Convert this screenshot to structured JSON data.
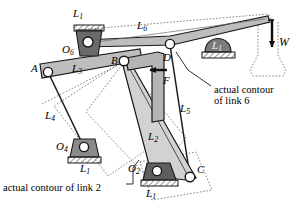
{
  "figure": {
    "colors": {
      "stroke": "#1a1a1a",
      "link_gray": "#b9b9b9",
      "link_gray_light": "#cfcfcf",
      "ground_dark": "#6e6e6e",
      "ground_mid": "#8d8d8d",
      "dotted": "#7a7a7a",
      "pin_fill": "#ffffff"
    }
  },
  "labels": [
    {
      "id": "L1_top",
      "base": "L",
      "sub": "1",
      "x": 73,
      "y": 8,
      "name": "label-l1-top"
    },
    {
      "id": "L6",
      "base": "L",
      "sub": "6",
      "x": 137,
      "y": 20,
      "name": "label-l6"
    },
    {
      "id": "O6",
      "base": "O",
      "sub": "6",
      "x": 62,
      "y": 44,
      "name": "label-o6"
    },
    {
      "id": "L1_right",
      "base": "L",
      "sub": "1",
      "x": 212,
      "y": 40,
      "name": "label-l1-right"
    },
    {
      "id": "W",
      "base": "W",
      "sub": "",
      "x": 279,
      "y": 36,
      "name": "label-w"
    },
    {
      "id": "A",
      "base": "A",
      "sub": "",
      "x": 31,
      "y": 63,
      "name": "label-a"
    },
    {
      "id": "L3",
      "base": "L",
      "sub": "3",
      "x": 72,
      "y": 66,
      "name": "label-l3"
    },
    {
      "id": "B",
      "base": "B",
      "sub": "",
      "x": 111,
      "y": 57,
      "name": "label-b"
    },
    {
      "id": "D",
      "base": "D",
      "sub": "",
      "x": 163,
      "y": 54,
      "name": "label-d"
    },
    {
      "id": "F",
      "base": "F",
      "sub": "",
      "x": 163,
      "y": 78,
      "name": "label-f"
    },
    {
      "id": "L5",
      "base": "L",
      "sub": "5",
      "x": 180,
      "y": 103,
      "name": "label-l5"
    },
    {
      "id": "L4",
      "base": "L",
      "sub": "4",
      "x": 45,
      "y": 110,
      "name": "label-l4"
    },
    {
      "id": "L2",
      "base": "L",
      "sub": "2",
      "x": 148,
      "y": 131,
      "name": "label-l2"
    },
    {
      "id": "O4",
      "base": "O",
      "sub": "4",
      "x": 56,
      "y": 141,
      "name": "label-o4"
    },
    {
      "id": "L1_o4",
      "base": "L",
      "sub": "1",
      "x": 80,
      "y": 163,
      "name": "label-l1-o4"
    },
    {
      "id": "O2",
      "base": "O",
      "sub": "2",
      "x": 128,
      "y": 165,
      "name": "label-o2"
    },
    {
      "id": "C",
      "base": "C",
      "sub": "",
      "x": 197,
      "y": 166,
      "name": "label-c"
    },
    {
      "id": "L1_o2",
      "base": "L",
      "sub": "1",
      "x": 146,
      "y": 189,
      "name": "label-l1-o2"
    }
  ],
  "captions": [
    {
      "id": "contour6",
      "lines": [
        "actual contour",
        "of link 6"
      ],
      "x": 214,
      "y": 84,
      "name": "caption-actual-contour-link6"
    },
    {
      "id": "contour2",
      "lines": [
        "actual contour of link 2"
      ],
      "x": 3,
      "y": 183,
      "name": "caption-actual-contour-link2"
    }
  ],
  "joints": [
    {
      "id": "O6",
      "x": 88,
      "y": 42,
      "r": 5.0,
      "name": "joint-o6"
    },
    {
      "id": "D",
      "x": 170,
      "y": 44,
      "r": 4.6,
      "name": "joint-d"
    },
    {
      "id": "A",
      "x": 48,
      "y": 72,
      "r": 4.6,
      "name": "joint-a"
    },
    {
      "id": "B",
      "x": 124,
      "y": 61,
      "r": 4.8,
      "name": "joint-b"
    },
    {
      "id": "O4",
      "x": 84,
      "y": 147,
      "r": 4.6,
      "name": "joint-o4"
    },
    {
      "id": "O2",
      "x": 157,
      "y": 171,
      "r": 4.6,
      "name": "joint-o2"
    },
    {
      "id": "C",
      "x": 190,
      "y": 177,
      "r": 4.8,
      "name": "joint-c"
    }
  ],
  "force_arrows": [
    {
      "id": "W",
      "x1": 272,
      "y1": 20,
      "x2": 272,
      "y2": 49,
      "name": "load-arrow-w"
    },
    {
      "id": "F",
      "x1": 166,
      "y1": 70,
      "x2": 148,
      "y2": 70,
      "name": "force-arrow-f"
    }
  ]
}
